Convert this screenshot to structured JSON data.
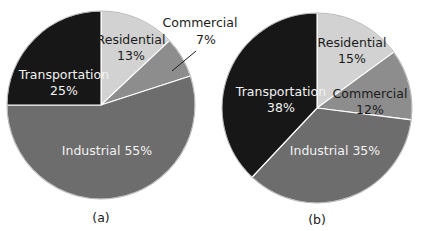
{
  "figure": {
    "background_color": "#ffffff",
    "text_color_on_dark": "#f2f2f2",
    "text_color_on_light": "#1b1b1b"
  },
  "palette": {
    "residential": "#d2d2d2",
    "commercial": "#8d8d8d",
    "industrial": "#6d6d6d",
    "transportation": "#171717",
    "outline": "#ffffff",
    "leader_line": "#1b1b1b"
  },
  "charts": [
    {
      "caption": "(a)",
      "center_x": 101,
      "center_y": 105,
      "radius": 94,
      "start_angle_deg": 0,
      "chart_data": {
        "type": "pie",
        "title": "(a)",
        "categories": [
          "Residential",
          "Commercial",
          "Industrial",
          "Transportation"
        ],
        "values": [
          13,
          7,
          55,
          25
        ],
        "labels": [
          "Residential 13%",
          "Commercial 7%",
          "Industrial 55%",
          "Transportation 25%"
        ],
        "colors": [
          "#d2d2d2",
          "#8d8d8d",
          "#6d6d6d",
          "#171717"
        ],
        "legend": "none",
        "units": "percent"
      },
      "slices": [
        {
          "name": "residential",
          "label": "Residential",
          "value_text": "13%",
          "value": 13,
          "color": "#d2d2d2",
          "label_placement": "inside",
          "label_x": 131,
          "label_y": 44,
          "value_x": 131,
          "value_y": 60,
          "text_class": "slice-label-light"
        },
        {
          "name": "commercial",
          "label": "Commercial",
          "value_text": "7%",
          "value": 7,
          "color": "#8d8d8d",
          "label_placement": "outside",
          "label_x": 200,
          "label_y": 27,
          "value_x": 206,
          "value_y": 44,
          "text_class": "outside-label",
          "leader": {
            "x1": 196,
            "y1": 51,
            "x2": 172,
            "y2": 71
          }
        },
        {
          "name": "industrial",
          "label": "Industrial 55%",
          "value_text": "",
          "value": 55,
          "color": "#6d6d6d",
          "label_placement": "inside",
          "label_x": 107,
          "label_y": 155,
          "text_class": "slice-label-dark"
        },
        {
          "name": "transportation",
          "label": "Transportation",
          "value_text": "25%",
          "value": 25,
          "color": "#171717",
          "label_placement": "inside",
          "label_x": 64,
          "label_y": 79,
          "value_x": 64,
          "value_y": 95,
          "text_class": "slice-label-dark"
        }
      ],
      "caption_x": 101,
      "caption_y": 222
    },
    {
      "caption": "(b)",
      "center_x": 317,
      "center_y": 108,
      "radius": 95,
      "start_angle_deg": 0,
      "chart_data": {
        "type": "pie",
        "title": "(b)",
        "categories": [
          "Residential",
          "Commercial",
          "Industrial",
          "Transportation"
        ],
        "values": [
          15,
          12,
          35,
          38
        ],
        "labels": [
          "Residential 15%",
          "Commercial 12%",
          "Industrial 35%",
          "Transportation 38%"
        ],
        "colors": [
          "#d2d2d2",
          "#8d8d8d",
          "#6d6d6d",
          "#171717"
        ],
        "legend": "none",
        "units": "percent"
      },
      "slices": [
        {
          "name": "residential",
          "label": "Residential",
          "value_text": "15%",
          "value": 15,
          "color": "#d2d2d2",
          "label_placement": "inside",
          "label_x": 352,
          "label_y": 47,
          "value_x": 352,
          "value_y": 63,
          "text_class": "slice-label-light"
        },
        {
          "name": "commercial",
          "label": "Commercial",
          "value_text": "12%",
          "value": 12,
          "color": "#8d8d8d",
          "label_placement": "inside",
          "label_x": 370,
          "label_y": 98,
          "value_x": 370,
          "value_y": 114,
          "text_class": "slice-label-light"
        },
        {
          "name": "industrial",
          "label": "Industrial 35%",
          "value_text": "",
          "value": 35,
          "color": "#6d6d6d",
          "label_placement": "inside",
          "label_x": 335,
          "label_y": 155,
          "text_class": "slice-label-dark"
        },
        {
          "name": "transportation",
          "label": "Transportation",
          "value_text": "38%",
          "value": 38,
          "color": "#171717",
          "label_placement": "inside",
          "label_x": 281,
          "label_y": 96,
          "value_x": 281,
          "value_y": 112,
          "text_class": "slice-label-dark"
        }
      ],
      "caption_x": 317,
      "caption_y": 224
    }
  ]
}
